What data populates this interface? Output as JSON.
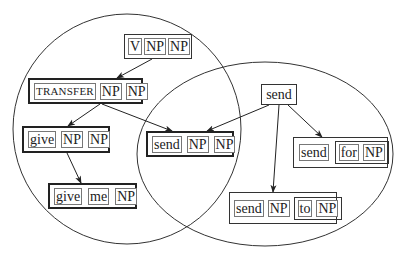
{
  "diagram": {
    "type": "construction-network",
    "regions": [
      {
        "id": "left-circle",
        "shape": "circle",
        "cx": 127,
        "cy": 129,
        "rx": 114,
        "ry": 115
      },
      {
        "id": "right-ellipse",
        "shape": "ellipse",
        "cx": 265,
        "cy": 154,
        "rx": 128,
        "ry": 92
      }
    ],
    "nodes": {
      "v_np_np": {
        "tokens": [
          "V",
          "NP",
          "NP"
        ]
      },
      "transfer_np_np": {
        "tokens": [
          "TRANSFER",
          "NP",
          "NP"
        ]
      },
      "give_np_np": {
        "tokens": [
          "give",
          "NP",
          "NP"
        ]
      },
      "give_me_np": {
        "tokens": [
          "give",
          "me",
          "NP"
        ]
      },
      "send_np_np": {
        "tokens": [
          "send",
          "NP",
          "NP"
        ]
      },
      "send": {
        "label": "send"
      },
      "send_for_np": {
        "tokens": [
          "send",
          "for",
          "NP"
        ]
      },
      "send_np_to_np": {
        "tokens": [
          "send",
          "NP",
          "to",
          "NP"
        ]
      }
    },
    "edges": [
      {
        "from": "v_np_np",
        "to": "transfer_np_np"
      },
      {
        "from": "transfer_np_np",
        "to": "give_np_np"
      },
      {
        "from": "transfer_np_np",
        "to": "send_np_np"
      },
      {
        "from": "give_np_np",
        "to": "give_me_np"
      },
      {
        "from": "send",
        "to": "send_np_np"
      },
      {
        "from": "send",
        "to": "send_for_np"
      },
      {
        "from": "send",
        "to": "send_np_to_np"
      }
    ],
    "colors": {
      "line": "#222222",
      "background": "#ffffff"
    }
  }
}
